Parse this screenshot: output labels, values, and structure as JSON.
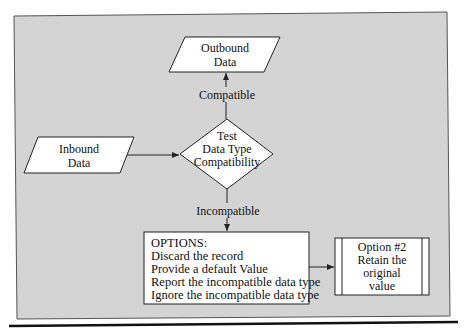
{
  "diagram": {
    "colors": {
      "panel_fill": "#d4d4d4",
      "shape_fill": "#ffffff",
      "stroke": "#222222",
      "rule": "#111111"
    },
    "nodes": {
      "outbound": {
        "shape": "parallelogram",
        "lines": [
          "Outbound",
          "Data"
        ]
      },
      "inbound": {
        "shape": "parallelogram",
        "lines": [
          "Inbound",
          "Data"
        ]
      },
      "decision": {
        "shape": "diamond",
        "lines": [
          "Test",
          "Data Type",
          "Compatibility"
        ]
      },
      "options": {
        "shape": "rectangle",
        "lines": [
          "OPTIONS:",
          "Discard the record",
          "Provide a default Value",
          "Report the incompatible data type",
          "Ignore the incompatible data type"
        ]
      },
      "option2": {
        "shape": "predefined-process",
        "lines": [
          "Option #2",
          "Retain the",
          "original",
          "value"
        ]
      }
    },
    "edges": {
      "inbound_to_decision": {
        "label": ""
      },
      "decision_to_outbound": {
        "label": "Compatible"
      },
      "decision_to_options": {
        "label": "Incompatible"
      },
      "options_to_option2": {
        "label": ""
      }
    }
  }
}
